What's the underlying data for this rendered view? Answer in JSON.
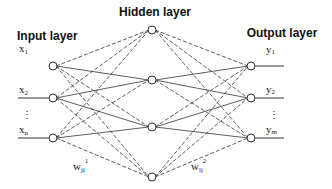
{
  "diagram": {
    "type": "neural-network",
    "titles": {
      "input_layer": "Input layer",
      "hidden_layer": "Hidden layer",
      "output_layer": "Output layer"
    },
    "inputs": [
      {
        "base": "x",
        "sub": "1"
      },
      {
        "base": "x",
        "sub": "2"
      },
      {
        "base": "x",
        "sub": "n"
      }
    ],
    "outputs": [
      {
        "base": "y",
        "sub": "1"
      },
      {
        "base": "y",
        "sub": "2"
      },
      {
        "base": "y",
        "sub": "m"
      }
    ],
    "ellipsis": "⋮",
    "hidden_node_count": 4,
    "weights": {
      "input_hidden": {
        "base": "w",
        "sub": "ji",
        "sup": "1"
      },
      "hidden_output": {
        "base": "w",
        "sub": "lj",
        "sup": "2"
      }
    },
    "colors": {
      "stroke": "#333333",
      "text": "#111111",
      "background": "#ffffff"
    }
  }
}
